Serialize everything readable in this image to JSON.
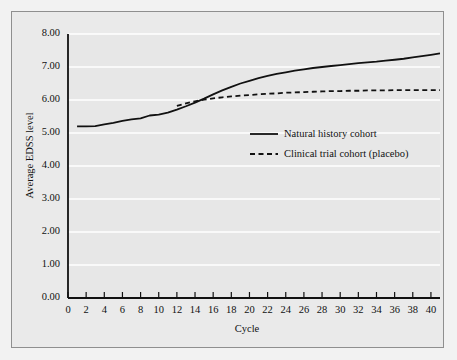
{
  "chart_data": {
    "type": "line",
    "title": "",
    "xlabel": "Cycle",
    "ylabel": "Average EDSS level",
    "xlim": [
      0,
      41
    ],
    "ylim": [
      0.0,
      8.0
    ],
    "grid": true,
    "legend_position": "center-right",
    "background_color": "#eaeaea",
    "gridline_color": "#ffffff",
    "line_color": "#111111",
    "x_tick_labels": [
      "0",
      "2",
      "4",
      "6",
      "8",
      "10",
      "12",
      "14",
      "16",
      "18",
      "20",
      "22",
      "24",
      "26",
      "28",
      "30",
      "32",
      "34",
      "36",
      "38",
      "40"
    ],
    "x_tick_values": [
      0,
      2,
      4,
      6,
      8,
      10,
      12,
      14,
      16,
      18,
      20,
      22,
      24,
      26,
      28,
      30,
      32,
      34,
      36,
      38,
      40
    ],
    "y_tick_labels": [
      "0.00",
      "1.00",
      "2.00",
      "3.00",
      "4.00",
      "5.00",
      "6.00",
      "7.00",
      "8.00"
    ],
    "y_tick_values": [
      0.0,
      1.0,
      2.0,
      3.0,
      4.0,
      5.0,
      6.0,
      7.0,
      8.0
    ],
    "series": [
      {
        "name": "Natural history cohort",
        "style": "solid",
        "x": [
          1,
          2,
          3,
          4,
          5,
          6,
          7,
          8,
          9,
          10,
          11,
          12,
          13,
          14,
          15,
          16,
          17,
          18,
          19,
          20,
          21,
          22,
          23,
          24,
          25,
          26,
          27,
          28,
          29,
          30,
          31,
          32,
          33,
          34,
          35,
          36,
          37,
          38,
          39,
          40,
          41
        ],
        "values": [
          5.2,
          5.2,
          5.21,
          5.26,
          5.31,
          5.37,
          5.41,
          5.44,
          5.53,
          5.56,
          5.62,
          5.71,
          5.81,
          5.92,
          6.04,
          6.17,
          6.29,
          6.4,
          6.5,
          6.58,
          6.66,
          6.73,
          6.79,
          6.84,
          6.89,
          6.93,
          6.97,
          7.0,
          7.03,
          7.06,
          7.09,
          7.12,
          7.14,
          7.16,
          7.19,
          7.22,
          7.25,
          7.29,
          7.33,
          7.37,
          7.41
        ]
      },
      {
        "name": "Clinical trial cohort (placebo)",
        "style": "dashed",
        "x": [
          12,
          13,
          14,
          15,
          16,
          17,
          18,
          19,
          20,
          21,
          22,
          23,
          24,
          25,
          26,
          27,
          28,
          29,
          30,
          31,
          32,
          33,
          34,
          35,
          36,
          37,
          38,
          39,
          40,
          41
        ],
        "values": [
          5.82,
          5.9,
          5.96,
          6.01,
          6.05,
          6.08,
          6.11,
          6.13,
          6.15,
          6.17,
          6.19,
          6.2,
          6.22,
          6.23,
          6.24,
          6.25,
          6.26,
          6.27,
          6.27,
          6.28,
          6.28,
          6.29,
          6.29,
          6.29,
          6.3,
          6.3,
          6.3,
          6.3,
          6.3,
          6.3
        ]
      }
    ]
  },
  "legend": {
    "items": [
      {
        "label": "Natural history cohort",
        "style": "solid"
      },
      {
        "label": "Clinical trial cohort (placebo)",
        "style": "dashed"
      }
    ]
  }
}
